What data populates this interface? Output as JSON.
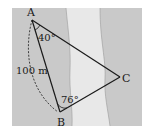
{
  "figure": {
    "type": "geometry-triangle-across-river",
    "colors": {
      "land": "#c9c9c9",
      "river": "#e8e8e8",
      "line": "#1a1a1a",
      "background": "#ffffff"
    },
    "points": {
      "A": {
        "label": "A"
      },
      "B": {
        "label": "B"
      },
      "C": {
        "label": "C"
      }
    },
    "angles": {
      "A": "40°",
      "B": "76°"
    },
    "side_AB": "100 m"
  }
}
